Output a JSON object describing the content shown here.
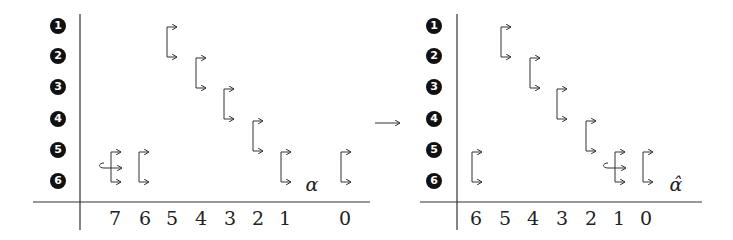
{
  "left_panel": {
    "row_markers": [
      "1",
      "2",
      "3",
      "4",
      "5",
      "6"
    ],
    "column_labels": [
      {
        "text": "7",
        "x": 115
      },
      {
        "text": "6",
        "x": 145
      },
      {
        "text": "5",
        "x": 172
      },
      {
        "text": "4",
        "x": 201
      },
      {
        "text": "3",
        "x": 230
      },
      {
        "text": "2",
        "x": 258
      },
      {
        "text": "1",
        "x": 285
      },
      {
        "text": "0",
        "x": 345
      }
    ],
    "symbol": "α"
  },
  "transition_arrow": "→",
  "right_panel": {
    "row_markers": [
      "1",
      "2",
      "3",
      "4",
      "5",
      "6"
    ],
    "column_labels": [
      {
        "text": "6",
        "x": 476
      },
      {
        "text": "5",
        "x": 505
      },
      {
        "text": "4",
        "x": 533
      },
      {
        "text": "3",
        "x": 562
      },
      {
        "text": "2",
        "x": 591
      },
      {
        "text": "1",
        "x": 619
      },
      {
        "text": "0",
        "x": 646
      }
    ],
    "symbol": "α̂"
  }
}
